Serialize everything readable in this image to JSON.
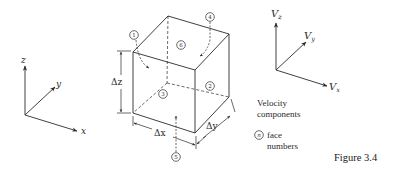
{
  "figure": {
    "caption": "Figure 3.4",
    "colors": {
      "ink": "#2a2a2a",
      "background": "#ffffff"
    }
  },
  "coordinate_axes": {
    "labels": {
      "x": "x",
      "y": "y",
      "z": "z"
    },
    "origin": [
      25,
      115
    ],
    "tips": {
      "z": [
        25,
        66
      ],
      "y": [
        55,
        87
      ],
      "x": [
        77,
        131
      ]
    }
  },
  "velocity_axes": {
    "labels": {
      "x": "V",
      "x_sub": "x",
      "y": "V",
      "y_sub": "y",
      "z": "V",
      "z_sub": "z"
    },
    "origin": [
      276,
      70
    ],
    "tips": {
      "z": [
        276,
        23
      ],
      "y": [
        306,
        42
      ],
      "x": [
        327,
        86
      ]
    }
  },
  "cube": {
    "vertices": {
      "FTL": [
        133,
        52
      ],
      "FTR": [
        195,
        70
      ],
      "BTL": [
        168,
        16
      ],
      "BTR": [
        229,
        34
      ],
      "FBL": [
        133,
        113
      ],
      "FBR": [
        195,
        133
      ],
      "BBL": [
        167,
        83
      ],
      "BBR": [
        229,
        97
      ]
    },
    "dimensions": {
      "dx": "Δx",
      "dy": "Δy",
      "dz": "Δz"
    },
    "faces": [
      {
        "n": "1",
        "pos": [
          134,
          35
        ]
      },
      {
        "n": "2",
        "pos": [
          210,
          86
        ]
      },
      {
        "n": "3",
        "pos": [
          163,
          94
        ]
      },
      {
        "n": "4",
        "pos": [
          210,
          17
        ]
      },
      {
        "n": "5",
        "pos": [
          176,
          157
        ]
      },
      {
        "n": "6",
        "pos": [
          181,
          45
        ]
      }
    ]
  },
  "legend": {
    "velocity_line1": "Velocity",
    "velocity_line2": "components",
    "face_symbol": "n",
    "face_line1": "face",
    "face_line2": "numbers"
  }
}
